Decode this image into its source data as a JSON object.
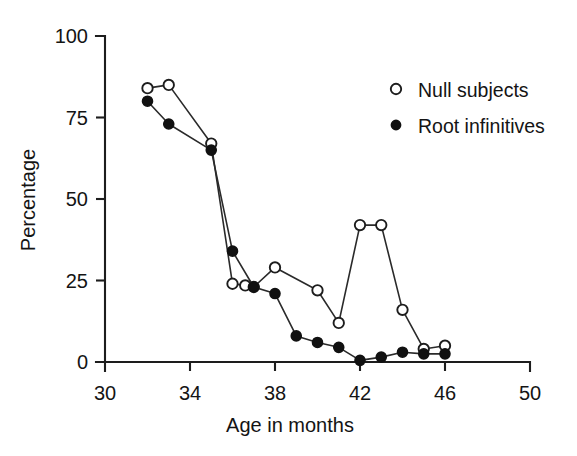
{
  "chart_data": {
    "type": "line",
    "title": "",
    "xlabel": "Age in months",
    "ylabel": "Percentage",
    "xlim": [
      30,
      50
    ],
    "ylim": [
      0,
      100
    ],
    "xticks": [
      30,
      34,
      38,
      42,
      46,
      50
    ],
    "yticks": [
      0,
      25,
      50,
      75,
      100
    ],
    "xtick_labels": [
      "30",
      "34",
      "38",
      "42",
      "46",
      "50"
    ],
    "ytick_labels": [
      "0",
      "25",
      "50",
      "75",
      "100"
    ],
    "grid": false,
    "legend_position": "upper right",
    "series": [
      {
        "name": "Null subjects",
        "marker": "open-circle",
        "points": [
          {
            "x": 32.0,
            "y": 84
          },
          {
            "x": 33.0,
            "y": 85
          },
          {
            "x": 35.0,
            "y": 67
          },
          {
            "x": 36.0,
            "y": 24
          },
          {
            "x": 36.6,
            "y": 23.5
          },
          {
            "x": 37.0,
            "y": 23
          },
          {
            "x": 38.0,
            "y": 29
          },
          {
            "x": 40.0,
            "y": 22
          },
          {
            "x": 41.0,
            "y": 12
          },
          {
            "x": 42.0,
            "y": 42
          },
          {
            "x": 43.0,
            "y": 42
          },
          {
            "x": 44.0,
            "y": 16
          },
          {
            "x": 45.0,
            "y": 4
          },
          {
            "x": 46.0,
            "y": 5
          }
        ]
      },
      {
        "name": "Root infinitives",
        "marker": "filled-circle",
        "points": [
          {
            "x": 32.0,
            "y": 80
          },
          {
            "x": 33.0,
            "y": 73
          },
          {
            "x": 35.0,
            "y": 65
          },
          {
            "x": 36.0,
            "y": 34
          },
          {
            "x": 37.0,
            "y": 23
          },
          {
            "x": 38.0,
            "y": 21
          },
          {
            "x": 39.0,
            "y": 8
          },
          {
            "x": 40.0,
            "y": 6
          },
          {
            "x": 41.0,
            "y": 4.5
          },
          {
            "x": 42.0,
            "y": 0.5
          },
          {
            "x": 43.0,
            "y": 1.5
          },
          {
            "x": 44.0,
            "y": 3
          },
          {
            "x": 45.0,
            "y": 2.5
          },
          {
            "x": 46.0,
            "y": 2.5
          }
        ]
      }
    ],
    "legend": [
      {
        "label": "Null subjects",
        "marker": "open-circle"
      },
      {
        "label": "Root infinitives",
        "marker": "filled-circle"
      }
    ],
    "colors": {
      "axis": "#1d1d1d",
      "line": "#2a2a2a",
      "marker_fill_open": "#ffffff",
      "marker_fill_solid": "#111111",
      "background": "#ffffff"
    }
  }
}
